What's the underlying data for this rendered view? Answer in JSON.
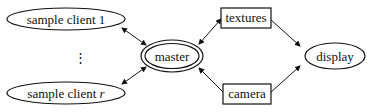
{
  "diagram": {
    "nodes": {
      "client1": {
        "label": "sample client 1",
        "shape": "ellipse"
      },
      "dots": {
        "label": "⋮"
      },
      "clientr": {
        "label_prefix": "sample client ",
        "label_var": "r",
        "shape": "ellipse"
      },
      "master": {
        "label": "master",
        "shape": "double-ellipse"
      },
      "textures": {
        "label": "textures",
        "shape": "box"
      },
      "camera": {
        "label": "camera",
        "shape": "box"
      },
      "display": {
        "label": "display",
        "shape": "ellipse"
      }
    },
    "edges": [
      {
        "from": "client1",
        "to": "master",
        "direction": "both"
      },
      {
        "from": "clientr",
        "to": "master",
        "direction": "both"
      },
      {
        "from": "master",
        "to": "textures",
        "direction": "both"
      },
      {
        "from": "camera",
        "to": "master",
        "direction": "forward"
      },
      {
        "from": "textures",
        "to": "display",
        "direction": "forward"
      },
      {
        "from": "camera",
        "to": "display",
        "direction": "forward"
      }
    ]
  }
}
